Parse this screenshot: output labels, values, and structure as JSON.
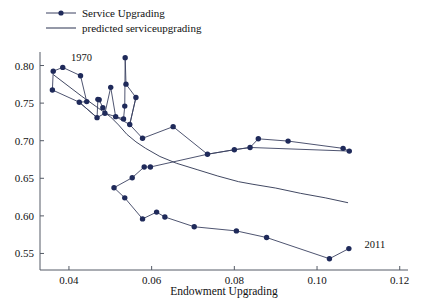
{
  "chart_data": {
    "type": "line",
    "title": "",
    "xlabel": "Endowment Upgrading",
    "ylabel": "",
    "xlim": [
      0.033,
      0.122
    ],
    "ylim": [
      0.528,
      0.818
    ],
    "xticks": [
      "0.04",
      "0.06",
      "0.08",
      "0.10",
      "0.12"
    ],
    "xtick_values": [
      0.04,
      0.06,
      0.08,
      0.1,
      0.12
    ],
    "yticks": [
      "0.55",
      "0.60",
      "0.65",
      "0.70",
      "0.75",
      "0.80"
    ],
    "ytick_values": [
      0.55,
      0.6,
      0.65,
      0.7,
      0.75,
      0.8
    ],
    "grid": false,
    "legend_position": "top-left",
    "annotations": [
      {
        "text": "1970",
        "x": 0.0405,
        "y": 0.806
      },
      {
        "text": "2011",
        "x": 0.1115,
        "y": 0.557
      }
    ],
    "series": [
      {
        "name": "Service Upgrading",
        "style": "line-markers",
        "color": "#1f2a5a",
        "marker": "circle",
        "points": [
          [
            0.0362,
            0.7925
          ],
          [
            0.0385,
            0.7975
          ],
          [
            0.036,
            0.7675
          ],
          [
            0.0425,
            0.7512
          ],
          [
            0.0428,
            0.7865
          ],
          [
            0.0443,
            0.752
          ],
          [
            0.047,
            0.755
          ],
          [
            0.0473,
            0.7545
          ],
          [
            0.0468,
            0.7307
          ],
          [
            0.0482,
            0.744
          ],
          [
            0.0487,
            0.7365
          ],
          [
            0.0501,
            0.771
          ],
          [
            0.0513,
            0.732
          ],
          [
            0.0532,
            0.729
          ],
          [
            0.0536,
            0.8105
          ],
          [
            0.0535,
            0.746
          ],
          [
            0.0538,
            0.7752
          ],
          [
            0.0547,
            0.7215
          ],
          [
            0.0562,
            0.7575
          ],
          [
            0.0578,
            0.7032
          ],
          [
            0.0652,
            0.7187
          ],
          [
            0.0735,
            0.682
          ],
          [
            0.08,
            0.688
          ],
          [
            0.0838,
            0.691
          ],
          [
            0.0858,
            0.7025
          ],
          [
            0.093,
            0.6995
          ],
          [
            0.1063,
            0.6898
          ],
          [
            0.1078,
            0.6862
          ],
          [
            0.0509,
            0.6375
          ],
          [
            0.0535,
            0.624
          ],
          [
            0.0553,
            0.6508
          ],
          [
            0.0578,
            0.596
          ],
          [
            0.0582,
            0.665
          ],
          [
            0.0597,
            0.665
          ],
          [
            0.0612,
            0.605
          ],
          [
            0.0632,
            0.5985
          ],
          [
            0.0703,
            0.5855
          ],
          [
            0.0805,
            0.58
          ],
          [
            0.0878,
            0.5712
          ],
          [
            0.103,
            0.543
          ],
          [
            0.1077,
            0.5565
          ]
        ],
        "path_order": [
          [
            0.036,
            0.7675
          ],
          [
            0.0362,
            0.7925
          ],
          [
            0.0385,
            0.7975
          ],
          [
            0.0428,
            0.7865
          ],
          [
            0.0443,
            0.752
          ],
          [
            0.0425,
            0.7512
          ],
          [
            0.0468,
            0.7307
          ],
          [
            0.047,
            0.755
          ],
          [
            0.0473,
            0.7545
          ],
          [
            0.0482,
            0.744
          ],
          [
            0.0487,
            0.7365
          ],
          [
            0.0501,
            0.771
          ],
          [
            0.0513,
            0.732
          ],
          [
            0.0532,
            0.729
          ],
          [
            0.0535,
            0.746
          ],
          [
            0.0536,
            0.8105
          ],
          [
            0.0538,
            0.7752
          ],
          [
            0.0562,
            0.7575
          ],
          [
            0.0547,
            0.7215
          ],
          [
            0.0578,
            0.7032
          ],
          [
            0.0652,
            0.7187
          ],
          [
            0.0735,
            0.682
          ],
          [
            0.08,
            0.688
          ],
          [
            0.0838,
            0.691
          ],
          [
            0.0858,
            0.7025
          ],
          [
            0.093,
            0.6995
          ],
          [
            0.1063,
            0.6898
          ],
          [
            0.1078,
            0.6862
          ]
        ],
        "path_order_2": [
          [
            0.0509,
            0.6375
          ],
          [
            0.0553,
            0.6508
          ],
          [
            0.0582,
            0.665
          ],
          [
            0.0597,
            0.665
          ],
          [
            0.0735,
            0.682
          ],
          [
            0.08,
            0.688
          ],
          [
            0.0838,
            0.691
          ],
          [
            0.1078,
            0.6862
          ]
        ],
        "path_order_3": [
          [
            0.0509,
            0.6375
          ],
          [
            0.0535,
            0.624
          ],
          [
            0.0578,
            0.596
          ],
          [
            0.0612,
            0.605
          ],
          [
            0.0632,
            0.5985
          ],
          [
            0.0703,
            0.5855
          ],
          [
            0.0805,
            0.58
          ],
          [
            0.0878,
            0.5712
          ],
          [
            0.103,
            0.543
          ],
          [
            0.1077,
            0.5565
          ]
        ],
        "path_order_4": [
          [
            0.036,
            0.7675
          ],
          [
            0.0425,
            0.7512
          ],
          [
            0.0468,
            0.7307
          ],
          [
            0.0487,
            0.7365
          ],
          [
            0.0513,
            0.732
          ],
          [
            0.0547,
            0.7215
          ],
          [
            0.0562,
            0.7575
          ]
        ]
      },
      {
        "name": "predicted serviceupgrading",
        "style": "line",
        "color": "#2b3350",
        "marker": "none",
        "points": [
          [
            0.0362,
            0.788
          ],
          [
            0.043,
            0.7595
          ],
          [
            0.0472,
            0.743
          ],
          [
            0.05,
            0.732
          ],
          [
            0.052,
            0.721
          ],
          [
            0.054,
            0.7085
          ],
          [
            0.0562,
            0.6985
          ],
          [
            0.0585,
            0.69
          ],
          [
            0.062,
            0.679
          ],
          [
            0.066,
            0.67
          ],
          [
            0.071,
            0.6615
          ],
          [
            0.076,
            0.653
          ],
          [
            0.081,
            0.6455
          ],
          [
            0.0845,
            0.642
          ],
          [
            0.09,
            0.637
          ],
          [
            0.096,
            0.63
          ],
          [
            0.102,
            0.624
          ],
          [
            0.1075,
            0.6175
          ]
        ]
      }
    ]
  },
  "legend": {
    "items": [
      {
        "label": "Service Upgrading",
        "marker": "circle-line"
      },
      {
        "label": "predicted serviceupgrading",
        "marker": "line"
      }
    ]
  },
  "axis": {
    "x_title": "Endowment Upgrading"
  }
}
